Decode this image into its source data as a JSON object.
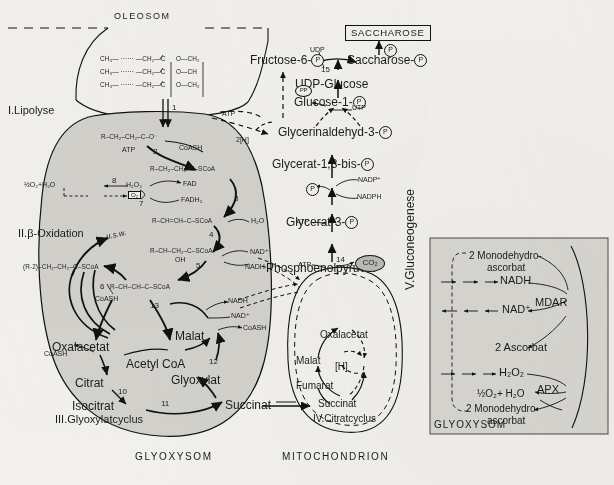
{
  "figure": {
    "title_regions": {
      "oleosom": "OLEOSOM",
      "glyoxysom_bottom": "GLYOXYSOM",
      "mitochondrion_bottom": "MITOCHONDRION",
      "glyoxysom_inset": "GLYOXYSOM",
      "saccharose_box": "SACCHAROSE"
    },
    "sections": [
      {
        "id": "I",
        "label": "I.Lipolyse"
      },
      {
        "id": "II",
        "label": "II.β-Oxidation"
      },
      {
        "id": "III",
        "label": "III.Glyoxylatcyclus"
      },
      {
        "id": "IV",
        "label": "IV.Citratcyclus"
      },
      {
        "id": "V",
        "label": "V.Gluconeogenese"
      }
    ]
  },
  "lipolysis": {
    "triglyceride_rows": [
      {
        "chain": "CH₃— ······ —CH₂—C",
        "ester": "O—CH₂"
      },
      {
        "chain": "CH₃— ······ —CH₂—C",
        "ester": "O—CH"
      },
      {
        "chain": "CH₃— ······ —CH₂—C",
        "ester": "O—CH₂"
      }
    ],
    "step": "1"
  },
  "beta_oxidation": {
    "metabolites": [
      {
        "id": "fatty-acid",
        "formula": "R–CH₂–CH₂–C–O⁻"
      },
      {
        "id": "acyl-coa",
        "formula": "R–CH₂–CH₂–C–SCoA"
      },
      {
        "id": "enoyl-coa",
        "formula": "R–CH=CH–C–SCoA"
      },
      {
        "id": "hydroxyacyl-coa",
        "formula": "R–CH–CH₂–C–SCoA"
      },
      {
        "id": "ketoacyl-coa",
        "formula": "R–CH–CH–C–SCoA"
      },
      {
        "id": "shortened-acyl",
        "formula": "(R-2)–CH₂–CH₂–C–SCoA"
      }
    ],
    "steps": [
      "2",
      "3",
      "4",
      "5",
      "6",
      "7",
      "8"
    ],
    "cofactors": {
      "atp": "ATP",
      "coash_1": "CoASH",
      "coash_2": "CoASH",
      "fad": "FAD",
      "fadh2": "FADH₂",
      "water_hydration": "H₂O",
      "nad_plus": "NAD⁺",
      "nadh": "NADH",
      "oh": "OH",
      "peroxide": "H₂O₂",
      "oxygen_box": "O₂",
      "catalase_products": "½O₂+H₂O",
      "usw": "u.s.w."
    }
  },
  "glyoxylate_cycle": {
    "metabolites": [
      "Oxalacetat",
      "Acetyl CoA",
      "Citrat",
      "Isocitrat",
      "Succinat",
      "Glyoxylat",
      "Malat"
    ],
    "steps": [
      "9",
      "10",
      "11",
      "12",
      "13"
    ],
    "cofactors": {
      "coash_citrate": "CoASH",
      "coash_malate": "CoASH",
      "nadh": "NADH",
      "nad_plus": "NAD⁺"
    }
  },
  "citrate_cycle": {
    "metabolites": [
      "Oxalacetat",
      "Malat",
      "Fumarat",
      "Succinat",
      "[H]"
    ],
    "transport_label": "Succinat"
  },
  "gluconeogenesis": {
    "metabolites": [
      {
        "name": "Phosphoenolpyruvat",
        "phosphate": false
      },
      {
        "name": "Glycerat-3-",
        "phosphate": true
      },
      {
        "name": "Glycerat-1,3-bis-",
        "phosphate": true
      },
      {
        "name": "Glycerinaldehyd-3-",
        "phosphate": true
      },
      {
        "name": "Glucose-1-",
        "phosphate": true
      },
      {
        "name": "UDP-Glucose",
        "phosphate": false
      },
      {
        "name": "Fructose-6-",
        "phosphate": true
      },
      {
        "name": "Saccharose-",
        "phosphate": true
      }
    ],
    "steps": [
      "14",
      "15"
    ],
    "cofactors": {
      "atp_pep": "ATP",
      "atp_glycerate": "ATP",
      "nadp_plus": "NADP⁺",
      "nadph": "NADPH",
      "phosphate_release": "P",
      "utp": "UTP",
      "pyrophosphate": "PP",
      "udp": "UDP",
      "co2": "CO₂",
      "atp_transfer": "ATP",
      "reducing_equivalents": "2[H]"
    }
  },
  "ascorbate_inset": {
    "entries": [
      {
        "id": "mdha-top",
        "text": "2 Monodehydro-"
      },
      {
        "id": "mdha-top-2",
        "text": "ascorbat"
      },
      {
        "id": "nadh",
        "text": "NADH"
      },
      {
        "id": "mdar",
        "text": "MDAR"
      },
      {
        "id": "nad",
        "text": "NAD⁺"
      },
      {
        "id": "ascorbat",
        "text": "2 Ascorbat"
      },
      {
        "id": "h2o2",
        "text": "H₂O₂"
      },
      {
        "id": "apx",
        "text": "APX"
      },
      {
        "id": "water",
        "text": "½O₂+ H₂O"
      },
      {
        "id": "mdha-bottom",
        "text": "2 Monodehydro-"
      },
      {
        "id": "mdha-bot-2",
        "text": "ascorbat"
      }
    ]
  },
  "colors": {
    "organelle_fill": "#d4d2cd",
    "inset_fill": "#d9d7d2",
    "stroke": "#111111",
    "paper": "#f3f1ed"
  }
}
